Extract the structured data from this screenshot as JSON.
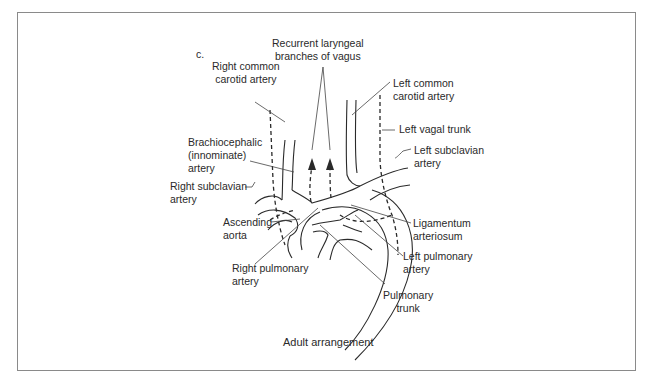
{
  "panel_label": "c.",
  "caption": "Adult arrangement",
  "labels": {
    "recurrent_laryngeal": [
      "Recurrent laryngeal",
      "branches of vagus"
    ],
    "right_common_carotid": [
      "Right common",
      "carotid artery"
    ],
    "left_common_carotid": [
      "Left common",
      "carotid artery"
    ],
    "left_vagal_trunk": [
      "Left vagal trunk"
    ],
    "brachiocephalic": [
      "Brachiocephalic",
      "(innominate)",
      "artery"
    ],
    "left_subclavian": [
      "Left subclavian",
      "artery"
    ],
    "right_subclavian": [
      "Right subclavian",
      "artery"
    ],
    "ascending_aorta": [
      "Ascending",
      "aorta"
    ],
    "ligamentum_arteriosum": [
      "Ligamentum",
      "arteriosum"
    ],
    "right_pulmonary": [
      "Right pulmonary",
      "artery"
    ],
    "left_pulmonary": [
      "Left pulmonary",
      "artery"
    ],
    "pulmonary_trunk": [
      "Pulmonary",
      "trunk"
    ]
  }
}
